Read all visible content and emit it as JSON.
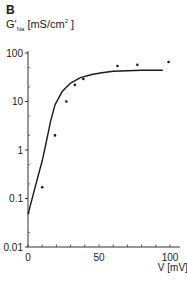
{
  "panel": {
    "letter": "B"
  },
  "axis": {
    "y_label_main": "G'",
    "y_label_sub": "Na",
    "y_label_unit_pre": " [mS/cm",
    "y_label_sup": "2",
    "y_label_unit_post": " ]",
    "x_label": "V [mV]",
    "y_ticks": [
      "100",
      "10",
      "1",
      "0.1",
      "0.01"
    ],
    "x_ticks": [
      "0",
      "50",
      "100"
    ]
  },
  "chart_data": {
    "type": "scatter",
    "title": "",
    "xlabel": "V [mV]",
    "ylabel": "G'Na [mS/cm²]",
    "yscale": "log",
    "xlim": [
      0,
      105
    ],
    "ylim": [
      0.01,
      100
    ],
    "x_ticks": [
      0,
      50,
      100
    ],
    "y_ticks": [
      0.01,
      0.1,
      1,
      10,
      100
    ],
    "grid": false,
    "series": [
      {
        "name": "measured",
        "kind": "scatter",
        "x": [
          10,
          19,
          27,
          33,
          39,
          63,
          77,
          99
        ],
        "y": [
          0.17,
          2.0,
          10,
          22,
          29,
          54,
          57,
          65
        ]
      },
      {
        "name": "fit",
        "kind": "line",
        "x": [
          0,
          5,
          10,
          12,
          16,
          19,
          24,
          30,
          37,
          45,
          52,
          60,
          80,
          95
        ],
        "y": [
          0.047,
          0.17,
          0.6,
          1.1,
          4,
          8.5,
          16,
          24,
          31,
          36,
          39,
          42,
          44,
          44
        ]
      }
    ]
  }
}
